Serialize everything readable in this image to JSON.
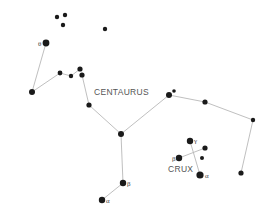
{
  "diagram": {
    "colors": {
      "background": "#ffffff",
      "star": "#1a1a1a",
      "line": "#b8b8b8",
      "label": "#555555"
    },
    "constellations": [
      {
        "name": "CENTAURUS",
        "label_pos": [
          94,
          95
        ]
      },
      {
        "name": "CRUX",
        "label_pos": [
          168,
          172
        ]
      }
    ],
    "stars": [
      {
        "id": "c1",
        "x": 57,
        "y": 17,
        "r": 2.2
      },
      {
        "id": "c2",
        "x": 65,
        "y": 15,
        "r": 2.2
      },
      {
        "id": "c3",
        "x": 63,
        "y": 25,
        "r": 2.2
      },
      {
        "id": "c4",
        "x": 105,
        "y": 29,
        "r": 2.2
      },
      {
        "id": "theta",
        "x": 46,
        "y": 43,
        "r": 3.4,
        "greek": "θ",
        "gx": 38,
        "gy": 46
      },
      {
        "id": "l1",
        "x": 32,
        "y": 92,
        "r": 3.0
      },
      {
        "id": "l2",
        "x": 60,
        "y": 73,
        "r": 2.4
      },
      {
        "id": "l3",
        "x": 71,
        "y": 76,
        "r": 2.2
      },
      {
        "id": "l4",
        "x": 80,
        "y": 69,
        "r": 2.6
      },
      {
        "id": "l5",
        "x": 82,
        "y": 75,
        "r": 2.6
      },
      {
        "id": "l6",
        "x": 89,
        "y": 105,
        "r": 2.6
      },
      {
        "id": "m1",
        "x": 121,
        "y": 134,
        "r": 3.0
      },
      {
        "id": "r1",
        "x": 169,
        "y": 95,
        "r": 3.0
      },
      {
        "id": "r2",
        "x": 174,
        "y": 91,
        "r": 1.8
      },
      {
        "id": "r3",
        "x": 205,
        "y": 102,
        "r": 2.6
      },
      {
        "id": "r4",
        "x": 253,
        "y": 120,
        "r": 2.2
      },
      {
        "id": "r5",
        "x": 241,
        "y": 173,
        "r": 2.6
      },
      {
        "id": "beta_cen",
        "x": 123,
        "y": 183,
        "r": 3.2,
        "greek": "β",
        "gx": 127,
        "gy": 186
      },
      {
        "id": "alpha_cen",
        "x": 102,
        "y": 200,
        "r": 3.2,
        "greek": "α",
        "gx": 106,
        "gy": 203
      },
      {
        "id": "gamma_cru",
        "x": 190,
        "y": 141,
        "r": 3.2,
        "greek": "γ",
        "gx": 194,
        "gy": 143
      },
      {
        "id": "beta_cru",
        "x": 179,
        "y": 158,
        "r": 3.2,
        "greek": "β",
        "gx": 172,
        "gy": 161
      },
      {
        "id": "delta_cru",
        "x": 205,
        "y": 148,
        "r": 2.6
      },
      {
        "id": "eps_cru",
        "x": 202,
        "y": 158,
        "r": 2.0
      },
      {
        "id": "alpha_cru",
        "x": 200,
        "y": 175,
        "r": 3.6,
        "greek": "α",
        "gx": 205,
        "gy": 178
      }
    ],
    "lines": [
      [
        "theta",
        "l1"
      ],
      [
        "l1",
        "l2"
      ],
      [
        "l2",
        "l3"
      ],
      [
        "l3",
        "l4"
      ],
      [
        "l5",
        "l6"
      ],
      [
        "l6",
        "m1"
      ],
      [
        "m1",
        "r1"
      ],
      [
        "r1",
        "r3"
      ],
      [
        "r3",
        "r4"
      ],
      [
        "r4",
        "r5"
      ],
      [
        "m1",
        "beta_cen"
      ],
      [
        "beta_cen",
        "alpha_cen"
      ],
      [
        "gamma_cru",
        "alpha_cru"
      ],
      [
        "beta_cru",
        "delta_cru"
      ]
    ]
  }
}
